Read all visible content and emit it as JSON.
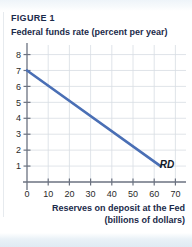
{
  "figure": {
    "label": "FIGURE 1",
    "y_axis_title": "Federal funds rate (percent per year)",
    "x_axis_caption_line1": "Reserves on deposit at the Fed",
    "x_axis_caption_line2": "(billions of dollars)"
  },
  "colors": {
    "curve": "#4a6fb5",
    "grid": "#d8dde3",
    "axis": "#6b7280",
    "text": "#1b2a4a",
    "band": "#e3edf5"
  },
  "chart_data": {
    "type": "line",
    "title": "FIGURE 1",
    "xlabel": "Reserves on deposit at the Fed (billions of dollars)",
    "ylabel": "Federal funds rate (percent per year)",
    "xlim": [
      0,
      75
    ],
    "ylim": [
      0,
      8.6
    ],
    "grid": true,
    "legend": "none",
    "xticks": [
      0,
      10,
      20,
      30,
      40,
      50,
      60,
      70
    ],
    "xtick_labels": [
      "0",
      "10",
      "20",
      "30",
      "40",
      "50",
      "60",
      "70"
    ],
    "yticks": [
      1,
      2,
      3,
      4,
      5,
      6,
      7,
      8
    ],
    "ytick_labels": [
      "1",
      "2",
      "3",
      "4",
      "5",
      "6",
      "7",
      "8"
    ],
    "series": [
      {
        "name": "RD",
        "label": "RD",
        "annotation": "RD",
        "color": "#4a6fb5",
        "x": [
          0,
          63
        ],
        "y": [
          7,
          1
        ],
        "points": [
          {
            "x": 0,
            "y": 7
          },
          {
            "x": 10,
            "y": 6.05
          },
          {
            "x": 20,
            "y": 5.1
          },
          {
            "x": 30,
            "y": 4.14
          },
          {
            "x": 40,
            "y": 3.19
          },
          {
            "x": 50,
            "y": 2.24
          },
          {
            "x": 60,
            "y": 1.29
          },
          {
            "x": 63,
            "y": 1
          }
        ]
      }
    ],
    "annotations": [
      {
        "text": "RD",
        "x": 66,
        "y": 0.85
      }
    ]
  }
}
